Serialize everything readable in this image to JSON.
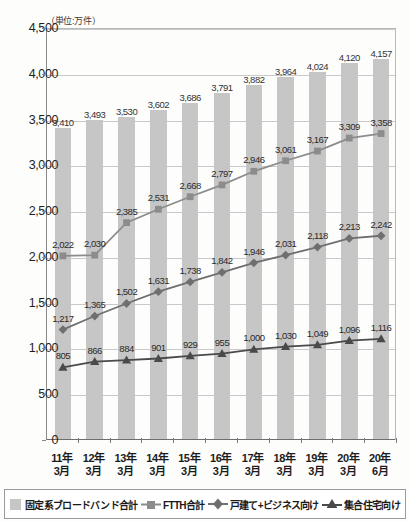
{
  "unit_note": "（単位:万件）",
  "legend": {
    "items": [
      {
        "label": "固定系ブロードバンド合計",
        "marker": "bar-swatch",
        "color": "#c6c6c6"
      },
      {
        "label": "FTTH合計",
        "marker": "square-marker",
        "color": "#8c8c8c"
      },
      {
        "label": "戸建て+ビジネス向け",
        "marker": "diamond-marker",
        "color": "#6f6f6f"
      },
      {
        "label": "集合住宅向け",
        "marker": "triangle-marker",
        "color": "#4a4a4a"
      }
    ]
  },
  "chart_data": {
    "type": "bar",
    "title": "",
    "subtitle": "",
    "xlabel": "",
    "ylabel": "（単位:万件）",
    "ylim": [
      0,
      4500
    ],
    "ytick_step": 500,
    "yticks": [
      "0",
      "500",
      "1,000",
      "1,500",
      "2,000",
      "2,500",
      "3,000",
      "3,500",
      "4,000",
      "4,500"
    ],
    "grid": true,
    "legend_position": "bottom",
    "categories": [
      "11年\n3月",
      "12年\n3月",
      "13年\n3月",
      "14年\n3月",
      "15年\n3月",
      "16年\n3月",
      "17年\n3月",
      "18年\n3月",
      "19年\n3月",
      "20年\n3月",
      "20年\n6月"
    ],
    "category_lines": [
      [
        "11年",
        "3月"
      ],
      [
        "12年",
        "3月"
      ],
      [
        "13年",
        "3月"
      ],
      [
        "14年",
        "3月"
      ],
      [
        "15年",
        "3月"
      ],
      [
        "16年",
        "3月"
      ],
      [
        "17年",
        "3月"
      ],
      [
        "18年",
        "3月"
      ],
      [
        "19年",
        "3月"
      ],
      [
        "20年",
        "3月"
      ],
      [
        "20年",
        "6月"
      ]
    ],
    "series": [
      {
        "name": "固定系ブロードバンド合計",
        "type": "bar",
        "color": "#c6c6c6",
        "values": [
          3410,
          3493,
          3530,
          3602,
          3686,
          3791,
          3882,
          3964,
          4024,
          4120,
          4157
        ],
        "labels": [
          "3,410",
          "3,493",
          "3,530",
          "3,602",
          "3,686",
          "3,791",
          "3,882",
          "3,964",
          "4,024",
          "4,120",
          "4,157"
        ]
      },
      {
        "name": "FTTH合計",
        "type": "line",
        "marker": "square",
        "color": "#8c8c8c",
        "values": [
          2022,
          2030,
          2385,
          2531,
          2668,
          2797,
          2946,
          3061,
          3167,
          3309,
          3358
        ],
        "labels": [
          "2,022",
          "2,030",
          "2,385",
          "2,531",
          "2,668",
          "2,797",
          "2,946",
          "3,061",
          "3,167",
          "3,309",
          "3,358"
        ]
      },
      {
        "name": "戸建て+ビジネス向け",
        "type": "line",
        "marker": "diamond",
        "color": "#6f6f6f",
        "values": [
          1217,
          1365,
          1502,
          1631,
          1738,
          1842,
          1946,
          2031,
          2118,
          2213,
          2242
        ],
        "labels": [
          "1,217",
          "1,365",
          "1,502",
          "1,631",
          "1,738",
          "1,842",
          "1,946",
          "2,031",
          "2,118",
          "2,213",
          "2,242"
        ]
      },
      {
        "name": "集合住宅向け",
        "type": "line",
        "marker": "triangle",
        "color": "#4a4a4a",
        "values": [
          805,
          866,
          884,
          901,
          929,
          955,
          1000,
          1030,
          1049,
          1096,
          1116
        ],
        "labels": [
          "805",
          "866",
          "884",
          "901",
          "929",
          "955",
          "1,000",
          "1,030",
          "1,049",
          "1,096",
          "1,116"
        ]
      }
    ]
  }
}
